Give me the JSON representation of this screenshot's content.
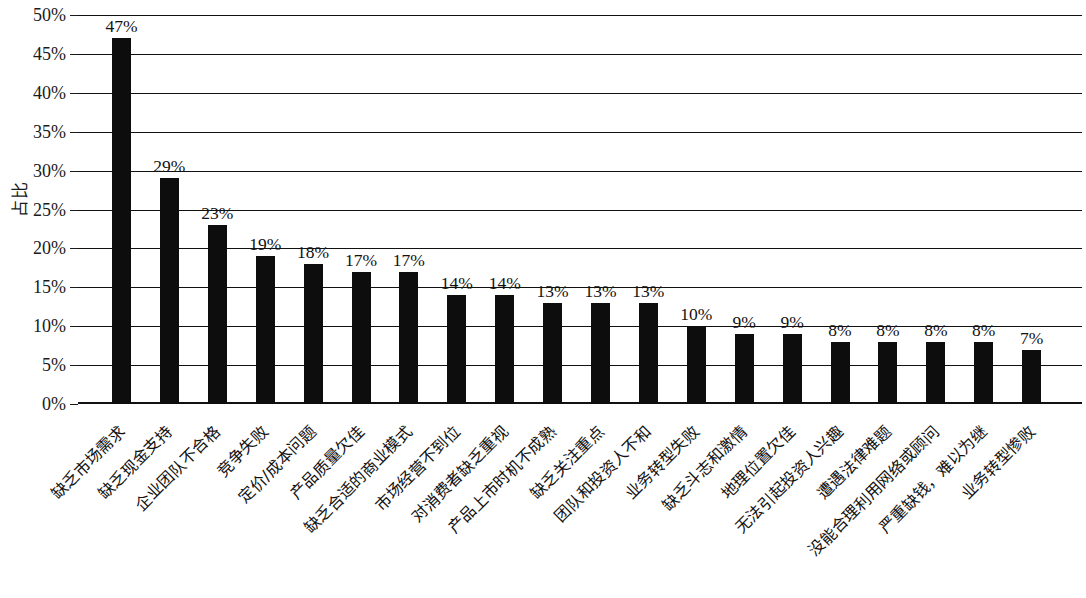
{
  "chart_data": {
    "type": "bar",
    "title": "",
    "xlabel": "",
    "ylabel": "占比",
    "ylim": [
      0,
      50
    ],
    "ytick_labels": [
      "50%",
      "45%",
      "40%",
      "35%",
      "30%",
      "25%",
      "20%",
      "15%",
      "10%",
      "5%",
      "0%"
    ],
    "ytick_values": [
      50,
      45,
      40,
      35,
      30,
      25,
      20,
      15,
      10,
      5,
      0
    ],
    "grid": true,
    "legend": "none",
    "bar_color": "#0d0d0d",
    "categories": [
      "缺乏市场需求",
      "缺乏现金支持",
      "企业团队不合格",
      "竞争失败",
      "定价/成本问题",
      "产品质量欠佳",
      "缺乏合适的商业模式",
      "市场经营不到位",
      "对消费者缺乏重视",
      "产品上市时机不成熟",
      "缺乏关注重点",
      "团队和投资人不和",
      "业务转型失败",
      "缺乏斗志和激情",
      "地理位置欠佳",
      "无法引起投资人兴趣",
      "遭遇法律难题",
      "没能合理利用网络或顾问",
      "严重缺钱，难以为继",
      "业务转型惨败"
    ],
    "values": [
      47,
      29,
      23,
      19,
      18,
      17,
      17,
      14,
      14,
      13,
      13,
      13,
      10,
      9,
      9,
      8,
      8,
      8,
      8,
      7
    ],
    "value_labels": [
      "47%",
      "29%",
      "23%",
      "19%",
      "18%",
      "17%",
      "17%",
      "14%",
      "14%",
      "13%",
      "13%",
      "13%",
      "10%",
      "9%",
      "9%",
      "8%",
      "8%",
      "8%",
      "8%",
      "7%"
    ]
  }
}
